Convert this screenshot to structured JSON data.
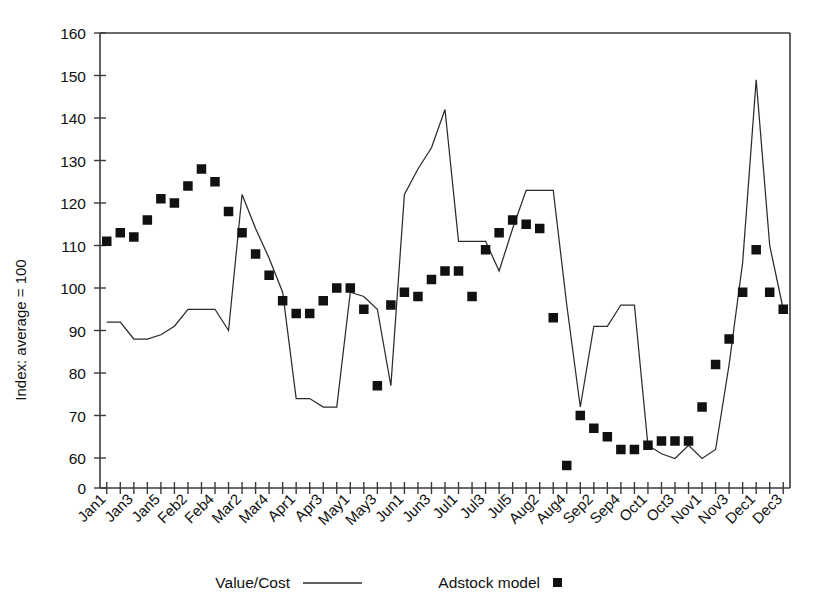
{
  "chart_data": {
    "type": "line",
    "title": "",
    "subtitle": "",
    "xlabel": "",
    "ylabel": "Index: average = 100",
    "ylim": [
      0,
      160
    ],
    "y_ticks": [
      0,
      60,
      70,
      80,
      90,
      100,
      110,
      120,
      130,
      140,
      150,
      160
    ],
    "y_axis_break": true,
    "grid": false,
    "legend_position": "bottom",
    "x_tick_labels": [
      "Jan1",
      "Jan3",
      "Jan5",
      "Feb2",
      "Feb4",
      "Mar2",
      "Mar4",
      "Apr1",
      "Apr3",
      "May1",
      "May3",
      "Jun1",
      "Jun3",
      "Jul1",
      "Jul3",
      "Jul5",
      "Aug2",
      "Aug4",
      "Sep2",
      "Sep4",
      "Oct1",
      "Oct3",
      "Nov1",
      "Nov3",
      "Dec1",
      "Dec3"
    ],
    "x": [
      "Jan1",
      "Jan2",
      "Jan3",
      "Jan4",
      "Jan5",
      "Feb1",
      "Feb2",
      "Feb3",
      "Feb4",
      "Mar1",
      "Mar2",
      "Mar3",
      "Mar4",
      "Apr1",
      "Apr2",
      "Apr3",
      "Apr4",
      "May1",
      "May2",
      "May3",
      "May4",
      "Jun1",
      "Jun2",
      "Jun3",
      "Jun4",
      "Jul1",
      "Jul2",
      "Jul3",
      "Jul4",
      "Jul5",
      "Aug1",
      "Aug2",
      "Aug3",
      "Aug4",
      "Sep1",
      "Sep2",
      "Sep3",
      "Sep4",
      "Sep5",
      "Oct1",
      "Oct2",
      "Oct3",
      "Oct4",
      "Nov1",
      "Nov2",
      "Nov3",
      "Nov4",
      "Dec1",
      "Dec2",
      "Dec3",
      "Dec4"
    ],
    "series": [
      {
        "name": "Value/Cost",
        "style": "line",
        "values": [
          92,
          92,
          88,
          88,
          89,
          91,
          95,
          95,
          95,
          90,
          122,
          114,
          107,
          99,
          74,
          74,
          72,
          72,
          99,
          98,
          95,
          77,
          122,
          128,
          133,
          142,
          111,
          111,
          111,
          104,
          114,
          123,
          123,
          123,
          96,
          72,
          91,
          91,
          96,
          96,
          63,
          61,
          59,
          63,
          59,
          62,
          82,
          106,
          149,
          110,
          95
        ]
      },
      {
        "name": "Adstock model",
        "style": "markers",
        "values": [
          111,
          113,
          112,
          116,
          121,
          120,
          124,
          128,
          125,
          118,
          113,
          108,
          103,
          97,
          94,
          94,
          97,
          100,
          100,
          95,
          77,
          96,
          99,
          98,
          102,
          104,
          104,
          98,
          109,
          113,
          116,
          115,
          114,
          93,
          45,
          70,
          67,
          65,
          62,
          62,
          63,
          64,
          64,
          64,
          72,
          82,
          88,
          99,
          109,
          99,
          95
        ]
      }
    ],
    "legend": [
      {
        "label": "Value/Cost",
        "marker": "line"
      },
      {
        "label": "Adstock model",
        "marker": "square"
      }
    ],
    "colors": {
      "line": "#2b2b2b",
      "marker": "#111111",
      "axis": "#3a3a3a"
    }
  },
  "axis": {
    "y_title": "Index: average = 100"
  }
}
